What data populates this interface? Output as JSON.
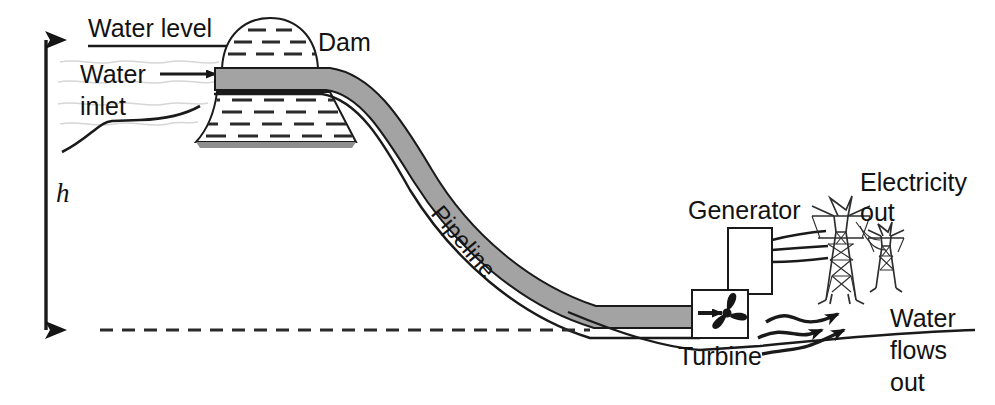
{
  "diagram": {
    "background_color": "#ffffff",
    "ink_color": "#1a1a1a",
    "pipe_fill_color": "#a3a3a3",
    "labels": {
      "water_level": "Water level",
      "water_inlet_line1": "Water",
      "water_inlet_line2": "inlet",
      "dam": "Dam",
      "height_symbol": "h",
      "pipeline": "Pipeline",
      "generator": "Generator",
      "turbine": "Turbine",
      "electricity_out_line1": "Electricity",
      "electricity_out_line2": "out",
      "water_flows_out_line1": "Water",
      "water_flows_out_line2": "flows",
      "water_flows_out_line3": "out"
    },
    "components": [
      "height-arrow",
      "water-level-line",
      "inlet-arrow",
      "dam-body",
      "dam-crest",
      "pipeline",
      "turbine-box",
      "generator-box",
      "power-lines",
      "pylon-large",
      "pylon-small",
      "outflow-arrows",
      "tailwater-datum-line",
      "terrain-line"
    ]
  }
}
